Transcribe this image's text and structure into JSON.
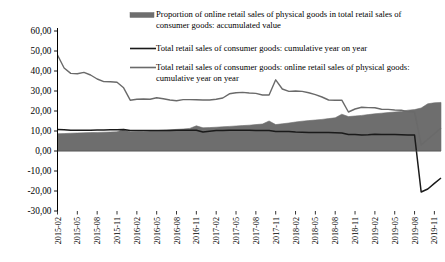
{
  "chart_data": {
    "type": "line",
    "title": "",
    "subtitle": "",
    "xlabel": "",
    "ylabel": "",
    "ylim": [
      -30,
      60
    ],
    "yticks": [
      "-30,00",
      "-20,00",
      "-10,00",
      "0,00",
      "10,00",
      "20,00",
      "30,00",
      "40,00",
      "50,00",
      "60,00"
    ],
    "ytick_values": [
      -30,
      -20,
      -10,
      0,
      10,
      20,
      30,
      40,
      50,
      60
    ],
    "grid": false,
    "legend_position": "top-right",
    "x": [
      "2015-02",
      "2015-03",
      "2015-04",
      "2015-05",
      "2015-06",
      "2015-07",
      "2015-08",
      "2015-09",
      "2015-10",
      "2015-11",
      "2015-12",
      "2016-02",
      "2016-03",
      "2016-04",
      "2016-05",
      "2016-06",
      "2016-07",
      "2016-08",
      "2016-09",
      "2016-10",
      "2016-11",
      "2016-12",
      "2017-02",
      "2017-03",
      "2017-04",
      "2017-05",
      "2017-06",
      "2017-07",
      "2017-08",
      "2017-09",
      "2017-10",
      "2017-11",
      "2017-12",
      "2018-02",
      "2018-03",
      "2018-04",
      "2018-05",
      "2018-06",
      "2018-07",
      "2018-08",
      "2018-09",
      "2018-10",
      "2018-11",
      "2018-12",
      "2019-02",
      "2019-03",
      "2019-04",
      "2019-05",
      "2019-06",
      "2019-07",
      "2019-08",
      "2019-09",
      "2019-10",
      "2019-11",
      "2019-12",
      "2020-02",
      "2020-03",
      "2020-04",
      "2020-05"
    ],
    "xtick_labels": [
      "2015-02",
      "2015-05",
      "2015-08",
      "2015-11",
      "2016-02",
      "2016-05",
      "2016-08",
      "2016-11",
      "2017-02",
      "2017-05",
      "2017-08",
      "2017-11",
      "2018-02",
      "2018-05",
      "2018-08",
      "2018-11",
      "2019-02",
      "2019-05",
      "2019-08",
      "2019-11",
      "2020-02",
      "2020-05"
    ],
    "series": [
      {
        "name": "Proportion of online retail sales of physical goods in total retail sales of consumer goods: accumulated value",
        "type": "area",
        "color": "#6e6e6e",
        "values": [
          8.6,
          8.7,
          8.9,
          9.0,
          9.1,
          9.2,
          9.3,
          9.4,
          9.5,
          9.6,
          10.8,
          9.6,
          9.7,
          9.8,
          10.0,
          10.2,
          10.4,
          10.6,
          10.8,
          11.0,
          11.3,
          12.6,
          11.6,
          11.7,
          11.9,
          12.1,
          12.3,
          12.5,
          12.7,
          12.9,
          13.2,
          13.5,
          15.0,
          13.2,
          13.6,
          14.0,
          14.5,
          14.9,
          15.2,
          15.5,
          15.8,
          16.2,
          16.6,
          18.4,
          17.2,
          17.5,
          17.8,
          18.2,
          18.6,
          18.9,
          19.2,
          19.5,
          19.8,
          20.4,
          20.7,
          21.5,
          23.6,
          24.1,
          24.3
        ]
      },
      {
        "name": "Total retail sales of consumer goods: cumulative year on year",
        "type": "line",
        "color": "#1a1a1a",
        "values": [
          10.7,
          10.6,
          10.4,
          10.4,
          10.4,
          10.4,
          10.5,
          10.5,
          10.6,
          10.6,
          10.7,
          10.2,
          10.3,
          10.3,
          10.2,
          10.3,
          10.3,
          10.3,
          10.4,
          10.4,
          10.4,
          10.4,
          9.5,
          9.9,
          10.2,
          10.3,
          10.4,
          10.4,
          10.4,
          10.4,
          10.3,
          10.3,
          10.2,
          9.7,
          9.8,
          9.7,
          9.5,
          9.4,
          9.3,
          9.3,
          9.3,
          9.2,
          9.1,
          9.0,
          8.2,
          8.3,
          8.0,
          8.1,
          8.4,
          8.3,
          8.2,
          8.2,
          8.1,
          8.0,
          8.0,
          -20.5,
          -19.0,
          -16.2,
          -13.5
        ]
      },
      {
        "name": "Total retail sales of consumer goods: online retail sales of physical goods: cumulative year on year",
        "type": "line",
        "color": "#6a6a6a",
        "values": [
          48.0,
          41.5,
          38.8,
          38.6,
          39.3,
          38.0,
          36.0,
          34.7,
          34.6,
          34.4,
          31.6,
          25.4,
          25.9,
          26.0,
          25.9,
          26.6,
          26.1,
          25.5,
          25.1,
          25.7,
          25.7,
          25.6,
          25.5,
          25.5,
          25.9,
          26.5,
          28.6,
          29.1,
          29.3,
          29.0,
          28.8,
          28.0,
          28.0,
          35.6,
          31.0,
          29.8,
          30.0,
          29.8,
          29.1,
          28.2,
          27.0,
          25.5,
          25.4,
          25.4,
          19.5,
          21.0,
          21.9,
          21.7,
          21.6,
          20.9,
          20.8,
          20.5,
          20.4,
          19.7,
          19.5,
          3.0,
          5.9,
          8.6,
          11.5
        ]
      }
    ],
    "legend": [
      {
        "label_line1": "Proportion of online retail sales of physical goods in total retail sales of",
        "label_line2": "consumer goods: accumulated value",
        "marker": "bar-swatch",
        "color": "#6e6e6e"
      },
      {
        "label_line1": "Total retail sales of consumer goods: cumulative year on year",
        "label_line2": "",
        "marker": "line-swatch",
        "color": "#1a1a1a"
      },
      {
        "label_line1": "Total retail sales of consumer goods: online retail sales of physical goods:",
        "label_line2": "cumulative year on year",
        "marker": "line-swatch",
        "color": "#6a6a6a"
      }
    ]
  }
}
